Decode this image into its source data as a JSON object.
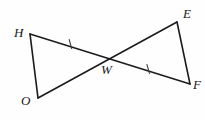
{
  "figure": {
    "background_color": "#fefefe",
    "line_color": "#1c1c20",
    "tick_color": "#3a3a40",
    "label_color": "#17171b",
    "vertices": [
      {
        "name": "H",
        "label": "H",
        "x": 30,
        "y": 34,
        "label_x": 14,
        "label_y": 26
      },
      {
        "name": "O",
        "label": "O",
        "x": 38,
        "y": 98,
        "label_x": 21,
        "label_y": 94
      },
      {
        "name": "W",
        "label": "W",
        "x": 107,
        "y": 59,
        "label_x": 101,
        "label_y": 63
      },
      {
        "name": "E",
        "label": "E",
        "x": 177,
        "y": 22,
        "label_x": 183,
        "label_y": 7
      },
      {
        "name": "F",
        "label": "F",
        "x": 190,
        "y": 84,
        "label_x": 193,
        "label_y": 78
      }
    ],
    "segments": [
      {
        "name": "segment-HO",
        "from": "H",
        "to": "O"
      },
      {
        "name": "segment-HF",
        "from": "H",
        "to": "F"
      },
      {
        "name": "segment-OE",
        "from": "O",
        "to": "E"
      },
      {
        "name": "segment-EF",
        "from": "E",
        "to": "F"
      }
    ],
    "congruence_ticks": [
      {
        "name": "tick-HW",
        "on_segment": "segment-HW",
        "x": 70,
        "y": 44,
        "marks": 1
      },
      {
        "name": "tick-WF",
        "on_segment": "segment-WF",
        "x": 148,
        "y": 69,
        "marks": 1
      }
    ]
  }
}
